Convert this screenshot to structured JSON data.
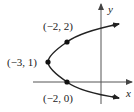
{
  "diagram": {
    "type": "parabola-graph",
    "equation_hint": "x = (y-1)^2 - 3",
    "axes": {
      "x_label": "x",
      "y_label": "y"
    },
    "points": [
      {
        "label": "(−2, 2)",
        "x": -2,
        "y": 2
      },
      {
        "label": "(−3, 1)",
        "x": -3,
        "y": 1
      },
      {
        "label": "(−2, 0)",
        "x": -2,
        "y": 0
      }
    ],
    "colors": {
      "curve": "#222222",
      "axis": "#555555",
      "point": "#111111"
    }
  }
}
